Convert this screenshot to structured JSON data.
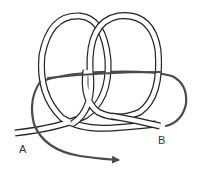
{
  "diagram": {
    "type": "knot",
    "labels": {
      "end_a": "A",
      "end_b": "B"
    },
    "colors": {
      "background": "#ffffff",
      "rope_outline": "#222222",
      "rope_fill": "#ffffff",
      "working_line": "#4a4a4a"
    }
  }
}
